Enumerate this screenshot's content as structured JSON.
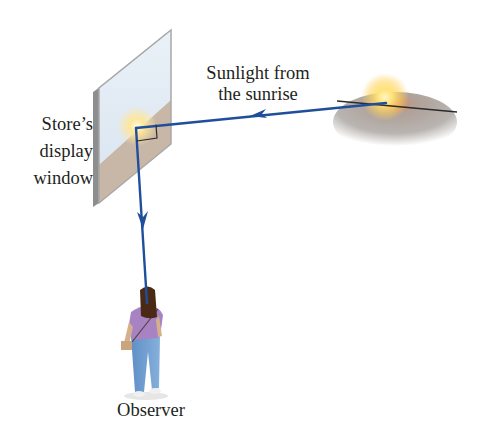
{
  "figure": {
    "type": "physics-reflection-diagram",
    "labels": {
      "sunlight": [
        "Sunlight from",
        "the sunrise"
      ],
      "window": [
        "Store’s",
        "display",
        "window"
      ],
      "observer": "Observer"
    },
    "elements": {
      "sun": "rising-sun-on-horizon",
      "window": "vertical-glass-pane-showing-sunrise-reflection",
      "observer": "girl-seen-from-behind",
      "ray": "incident-ray-from-sun-reflected-at-right-angle-down-to-observer",
      "right_angle_marker": true
    },
    "colors": {
      "ray": "#1f4e9a",
      "text": "#231f20",
      "window_frame": "#9a9a9a",
      "window_sky": "#dde8f2",
      "window_ground": "#c9b7a6",
      "sun_glow": "#ffd65a",
      "ground_shadow": "#9c9590",
      "shirt": "#a783c4",
      "jeans": "#6f9dd0",
      "hair": "#4a2a14"
    }
  }
}
